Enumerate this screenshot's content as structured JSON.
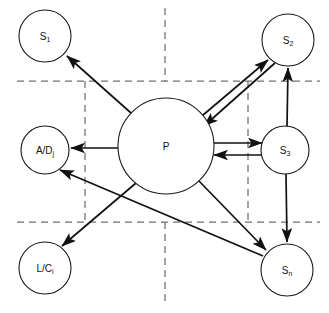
{
  "diagram": {
    "canvas": {
      "width": 329,
      "height": 313,
      "background": "#ffffff"
    },
    "colors": {
      "node_stroke": "#1a1a1a",
      "node_fill": "#ffffff",
      "edge": "#111111",
      "grid_dash": "#6f6f6f",
      "label": "#111111"
    },
    "nodes": [
      {
        "id": "s1",
        "label_main": "S",
        "label_sub": "1",
        "cx": 45,
        "cy": 36,
        "r": 26
      },
      {
        "id": "s2",
        "label_main": "S",
        "label_sub": "2",
        "cx": 288,
        "cy": 40,
        "r": 26
      },
      {
        "id": "p",
        "label_main": "P",
        "label_sub": "",
        "cx": 166,
        "cy": 146,
        "r": 48
      },
      {
        "id": "adj",
        "label_main": "A/D",
        "label_sub": "j",
        "cx": 45,
        "cy": 150,
        "r": 24
      },
      {
        "id": "s3",
        "label_main": "S",
        "label_sub": "3",
        "cx": 285,
        "cy": 150,
        "r": 24
      },
      {
        "id": "lci",
        "label_main": "L/C",
        "label_sub": "i",
        "cx": 45,
        "cy": 268,
        "r": 26
      },
      {
        "id": "sn",
        "label_main": "S",
        "label_sub": "n",
        "cx": 287,
        "cy": 270,
        "r": 26
      }
    ],
    "edges": [
      {
        "id": "p-to-s1",
        "from": "p",
        "to": "s1",
        "kind": "arrow"
      },
      {
        "id": "p-to-s2",
        "from": "p",
        "to": "s2",
        "kind": "arrow"
      },
      {
        "id": "s2-to-p",
        "from": "s2",
        "to": "p",
        "kind": "arrow"
      },
      {
        "id": "s3-to-s2",
        "from": "s3",
        "to": "s2",
        "kind": "arrow"
      },
      {
        "id": "p-to-adj",
        "from": "p",
        "to": "adj",
        "kind": "arrow"
      },
      {
        "id": "p-to-s3",
        "from": "p",
        "to": "s3",
        "kind": "arrow"
      },
      {
        "id": "s3-to-p",
        "from": "s3",
        "to": "p",
        "kind": "arrow"
      },
      {
        "id": "p-to-lci",
        "from": "p",
        "to": "lci",
        "kind": "arrow"
      },
      {
        "id": "p-to-sn",
        "from": "p",
        "to": "sn",
        "kind": "arrow"
      },
      {
        "id": "s3-to-sn",
        "from": "s3",
        "to": "sn",
        "kind": "arrow"
      },
      {
        "id": "sn-to-adj",
        "from": "sn",
        "to": "adj",
        "kind": "arrow"
      }
    ],
    "grid": {
      "horizontal": [
        {
          "id": "grid-h-top",
          "y": 81,
          "x1": 17,
          "x2": 320
        },
        {
          "id": "grid-h-bottom",
          "y": 222,
          "x1": 17,
          "x2": 320
        }
      ],
      "vertical": [
        {
          "id": "grid-v-left",
          "x": 85,
          "y1": 81,
          "y2": 222
        },
        {
          "id": "grid-v-right",
          "x": 248,
          "y1": 81,
          "y2": 222
        },
        {
          "id": "grid-v-center-upper",
          "x": 165,
          "y1": 8,
          "y2": 81
        },
        {
          "id": "grid-v-center-lower",
          "x": 165,
          "y1": 222,
          "y2": 305
        }
      ]
    }
  }
}
